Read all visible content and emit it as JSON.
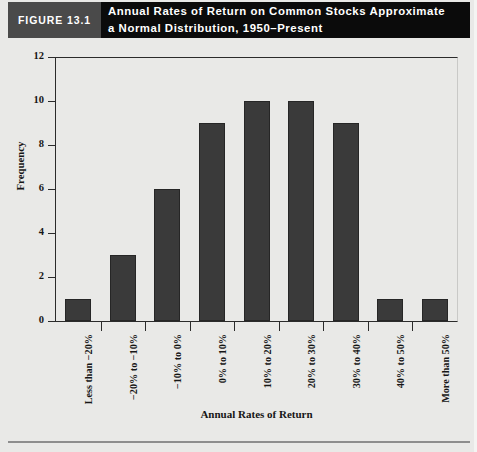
{
  "header": {
    "figure_label": "FIGURE 13.1",
    "title_line1": "Annual Rates of Return on Common Stocks Approximate",
    "title_line2": "a Normal Distribution, 1950–Present",
    "gray_box_color": "#4a4a4a",
    "black_box_color": "#0b0b0b",
    "text_color": "#ffffff"
  },
  "footer": {
    "source_text": ""
  },
  "chart_data": {
    "type": "bar",
    "title": "Annual Rates of Return on Common Stocks Approximate a Normal Distribution, 1950–Present",
    "xlabel": "Annual Rates of Return",
    "ylabel": "Frequency",
    "categories": [
      "Less than −20%",
      "−20% to −10%",
      "−10% to 0%",
      "0% to 10%",
      "10% to 20%",
      "20% to 30%",
      "30% to 40%",
      "40% to 50%",
      "More than 50%"
    ],
    "values": [
      1,
      3,
      6,
      9,
      10,
      10,
      9,
      1,
      1
    ],
    "ylim": [
      0,
      12
    ],
    "yticks": [
      0,
      2,
      4,
      6,
      8,
      10,
      12
    ],
    "ytick_labels": [
      "0",
      "2",
      "4",
      "6",
      "8",
      "10",
      "12"
    ],
    "grid": false,
    "legend": false,
    "bar_color": "#3a3a3a",
    "axis_color": "#2b2b2b",
    "plot_background": "#e9e9e7"
  }
}
